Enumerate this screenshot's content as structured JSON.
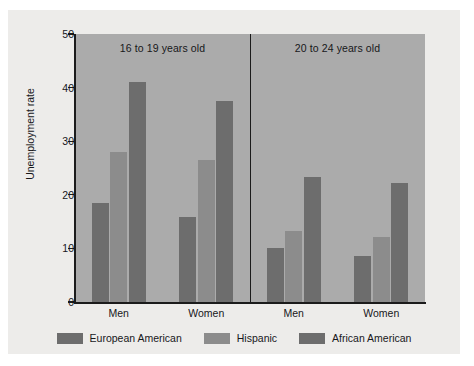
{
  "chart_data": {
    "type": "bar",
    "title": "",
    "xlabel": "",
    "ylabel": "Unemployment rate",
    "ylim": [
      0,
      50
    ],
    "yticks": [
      0,
      10,
      20,
      30,
      40,
      50
    ],
    "grid": false,
    "legend_position": "bottom",
    "panels": [
      {
        "title": "16 to 19 years old",
        "categories": [
          "Men",
          "Women"
        ],
        "series": [
          {
            "name": "European American",
            "values": [
              18.5,
              15.8
            ]
          },
          {
            "name": "Hispanic",
            "values": [
              28.0,
              26.5
            ]
          },
          {
            "name": "African American",
            "values": [
              41.0,
              37.5
            ]
          }
        ]
      },
      {
        "title": "20 to 24 years old",
        "categories": [
          "Men",
          "Women"
        ],
        "series": [
          {
            "name": "European American",
            "values": [
              10.0,
              8.6
            ]
          },
          {
            "name": "Hispanic",
            "values": [
              13.2,
              12.1
            ]
          },
          {
            "name": "African American",
            "values": [
              23.3,
              22.2
            ]
          }
        ]
      }
    ],
    "legend": [
      {
        "label": "European American",
        "color": "#6d6d6d"
      },
      {
        "label": "Hispanic",
        "color": "#8c8c8c"
      },
      {
        "label": "African American",
        "color": "#6d6d6d"
      }
    ],
    "colors": {
      "plot_background": "#ababab",
      "figure_background": "#edecea",
      "axis": "#1b1b1b",
      "bar_dark": "#6d6d6d",
      "bar_light": "#8c8c8c"
    }
  }
}
